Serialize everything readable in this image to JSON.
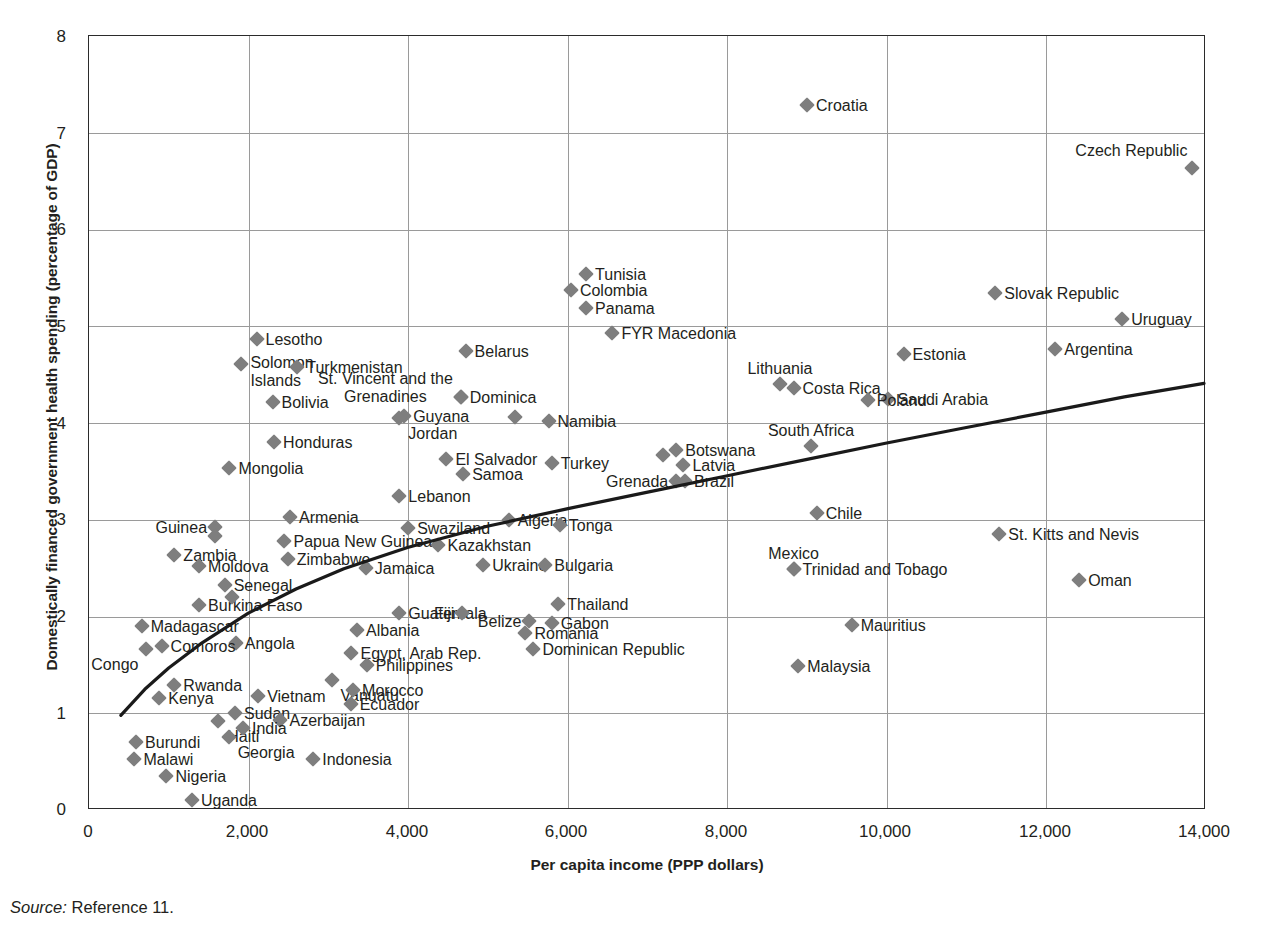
{
  "figure": {
    "source_prefix": "Source:",
    "source_text": " Reference 11."
  },
  "chart_data": {
    "type": "scatter",
    "title": "",
    "xlabel": "Per capita income (PPP dollars)",
    "ylabel": "Domestically financed government health spending (percentage of GDP)",
    "xlim": [
      0,
      14000
    ],
    "ylim": [
      0,
      8
    ],
    "xticks": [
      "0",
      "2,000",
      "4,000",
      "6,000",
      "8,000",
      "10,000",
      "12,000",
      "14,000"
    ],
    "xtick_values": [
      0,
      2000,
      4000,
      6000,
      8000,
      10000,
      12000,
      14000
    ],
    "yticks": [
      "0",
      "1",
      "2",
      "3",
      "4",
      "5",
      "6",
      "7",
      "8"
    ],
    "ytick_values": [
      0,
      1,
      2,
      3,
      4,
      5,
      6,
      7,
      8
    ],
    "grid": true,
    "legend": "none",
    "marker": "diamond",
    "marker_color": "#7e7e7e",
    "trend_line": {
      "label": "fitted trend",
      "color": "#1a1a1a",
      "points": [
        {
          "x": 400,
          "y": 0.96
        },
        {
          "x": 700,
          "y": 1.23
        },
        {
          "x": 1000,
          "y": 1.45
        },
        {
          "x": 1400,
          "y": 1.7
        },
        {
          "x": 2000,
          "y": 2.02
        },
        {
          "x": 2600,
          "y": 2.27
        },
        {
          "x": 3200,
          "y": 2.48
        },
        {
          "x": 4000,
          "y": 2.7
        },
        {
          "x": 5000,
          "y": 2.92
        },
        {
          "x": 6000,
          "y": 3.1
        },
        {
          "x": 7000,
          "y": 3.27
        },
        {
          "x": 8000,
          "y": 3.44
        },
        {
          "x": 9000,
          "y": 3.61
        },
        {
          "x": 10000,
          "y": 3.78
        },
        {
          "x": 11000,
          "y": 3.94
        },
        {
          "x": 12000,
          "y": 4.1
        },
        {
          "x": 13000,
          "y": 4.26
        },
        {
          "x": 14000,
          "y": 4.4
        }
      ]
    },
    "points": [
      {
        "name": "Croatia",
        "x": 9000,
        "y": 7.29,
        "lbl": "r"
      },
      {
        "name": "Czech Republic",
        "x": 13830,
        "y": 6.64,
        "lbl": "above-left"
      },
      {
        "name": "Tunisia",
        "x": 6230,
        "y": 5.54,
        "lbl": "r"
      },
      {
        "name": "Colombia",
        "x": 6040,
        "y": 5.37,
        "lbl": "r"
      },
      {
        "name": "Panama",
        "x": 6230,
        "y": 5.19,
        "lbl": "r"
      },
      {
        "name": "Slovak Republic",
        "x": 11360,
        "y": 5.34,
        "lbl": "r"
      },
      {
        "name": "Uruguay",
        "x": 12950,
        "y": 5.08,
        "lbl": "r"
      },
      {
        "name": "FYR Macedonia",
        "x": 6560,
        "y": 4.93,
        "lbl": "r"
      },
      {
        "name": "Lesotho",
        "x": 2100,
        "y": 4.87,
        "lbl": "r"
      },
      {
        "name": "Belarus",
        "x": 4720,
        "y": 4.74,
        "lbl": "r"
      },
      {
        "name": "Argentina",
        "x": 12110,
        "y": 4.77,
        "lbl": "r"
      },
      {
        "name": "Estonia",
        "x": 10210,
        "y": 4.71,
        "lbl": "r"
      },
      {
        "name": "Solomon Islands",
        "x": 1910,
        "y": 4.61,
        "lbl": "r-two"
      },
      {
        "name": "Turkmenistan",
        "x": 2610,
        "y": 4.58,
        "lbl": "r"
      },
      {
        "name": "Lithuania",
        "x": 8660,
        "y": 4.4,
        "lbl": "above"
      },
      {
        "name": "Costa Rica",
        "x": 8830,
        "y": 4.36,
        "lbl": "r"
      },
      {
        "name": "St. Vincent and the Grenadines",
        "x": 4660,
        "y": 4.27,
        "lbl": "l-two"
      },
      {
        "name": "Dominica",
        "x": 4660,
        "y": 4.27,
        "lbl": "r"
      },
      {
        "name": "Saudi Arabia",
        "x": 10020,
        "y": 4.25,
        "lbl": "r"
      },
      {
        "name": "Poland",
        "x": 9760,
        "y": 4.24,
        "lbl": "r"
      },
      {
        "name": "Bolivia",
        "x": 2300,
        "y": 4.22,
        "lbl": "r"
      },
      {
        "name": "Guyana",
        "x": 3950,
        "y": 4.07,
        "lbl": "r"
      },
      {
        "name": "Jordan",
        "x": 3890,
        "y": 4.05,
        "lbl": "r-below"
      },
      {
        "name": "Samoa-north",
        "x": 5340,
        "y": 4.06,
        "lbl": "none"
      },
      {
        "name": "Namibia",
        "x": 5760,
        "y": 4.02,
        "lbl": "r"
      },
      {
        "name": "Honduras",
        "x": 2320,
        "y": 3.8,
        "lbl": "r"
      },
      {
        "name": "South Africa",
        "x": 9050,
        "y": 3.76,
        "lbl": "above"
      },
      {
        "name": "Botswana",
        "x": 7360,
        "y": 3.72,
        "lbl": "r"
      },
      {
        "name": "Botswana-pair",
        "x": 7200,
        "y": 3.67,
        "lbl": "none"
      },
      {
        "name": "Latvia",
        "x": 7450,
        "y": 3.57,
        "lbl": "r"
      },
      {
        "name": "Mongolia",
        "x": 1760,
        "y": 3.53,
        "lbl": "r"
      },
      {
        "name": "El Salvador",
        "x": 4480,
        "y": 3.63,
        "lbl": "r"
      },
      {
        "name": "Turkey",
        "x": 5800,
        "y": 3.59,
        "lbl": "r"
      },
      {
        "name": "Samoa",
        "x": 4690,
        "y": 3.47,
        "lbl": "r"
      },
      {
        "name": "Grenada",
        "x": 7360,
        "y": 3.4,
        "lbl": "l"
      },
      {
        "name": "Brazil",
        "x": 7470,
        "y": 3.4,
        "lbl": "r"
      },
      {
        "name": "Lebanon",
        "x": 3890,
        "y": 3.25,
        "lbl": "r"
      },
      {
        "name": "Chile",
        "x": 9120,
        "y": 3.07,
        "lbl": "r"
      },
      {
        "name": "Armenia",
        "x": 2520,
        "y": 3.03,
        "lbl": "r"
      },
      {
        "name": "Algeria",
        "x": 5260,
        "y": 3.0,
        "lbl": "r"
      },
      {
        "name": "Tonga",
        "x": 5900,
        "y": 2.95,
        "lbl": "r"
      },
      {
        "name": "Swaziland",
        "x": 4000,
        "y": 2.91,
        "lbl": "r"
      },
      {
        "name": "St. Kitts and Nevis",
        "x": 11410,
        "y": 2.85,
        "lbl": "r"
      },
      {
        "name": "Papua New Guinea",
        "x": 2450,
        "y": 2.78,
        "lbl": "r"
      },
      {
        "name": "Kazakhstan",
        "x": 4380,
        "y": 2.74,
        "lbl": "r"
      },
      {
        "name": "Guinea",
        "x": 1580,
        "y": 2.93,
        "lbl": "l"
      },
      {
        "name": "Guinea-pair",
        "x": 1580,
        "y": 2.83,
        "lbl": "none"
      },
      {
        "name": "Zambia",
        "x": 1070,
        "y": 2.64,
        "lbl": "r"
      },
      {
        "name": "Zimbabwe",
        "x": 2490,
        "y": 2.59,
        "lbl": "r"
      },
      {
        "name": "Moldova",
        "x": 1380,
        "y": 2.52,
        "lbl": "r"
      },
      {
        "name": "Jamaica",
        "x": 3470,
        "y": 2.5,
        "lbl": "r"
      },
      {
        "name": "Ukraine",
        "x": 4940,
        "y": 2.53,
        "lbl": "r"
      },
      {
        "name": "Bulgaria",
        "x": 5720,
        "y": 2.53,
        "lbl": "r"
      },
      {
        "name": "Mexico",
        "x": 8830,
        "y": 2.49,
        "lbl": "above"
      },
      {
        "name": "Trinidad and Tobago",
        "x": 8830,
        "y": 2.49,
        "lbl": "r"
      },
      {
        "name": "Oman",
        "x": 12410,
        "y": 2.38,
        "lbl": "r"
      },
      {
        "name": "Senegal",
        "x": 1700,
        "y": 2.33,
        "lbl": "r"
      },
      {
        "name": "Burkina Faso",
        "x": 1380,
        "y": 2.12,
        "lbl": "r"
      },
      {
        "name": "Burkina-pair",
        "x": 1790,
        "y": 2.2,
        "lbl": "none"
      },
      {
        "name": "Guatemala",
        "x": 3890,
        "y": 2.04,
        "lbl": "r"
      },
      {
        "name": "Fiji",
        "x": 4680,
        "y": 2.04,
        "lbl": "l"
      },
      {
        "name": "Thailand",
        "x": 5880,
        "y": 2.13,
        "lbl": "r"
      },
      {
        "name": "Belize",
        "x": 5520,
        "y": 1.95,
        "lbl": "l"
      },
      {
        "name": "Gabon",
        "x": 5800,
        "y": 1.93,
        "lbl": "r"
      },
      {
        "name": "Madagascar",
        "x": 660,
        "y": 1.9,
        "lbl": "r"
      },
      {
        "name": "Angola",
        "x": 1840,
        "y": 1.73,
        "lbl": "r"
      },
      {
        "name": "Romania",
        "x": 5470,
        "y": 1.83,
        "lbl": "r"
      },
      {
        "name": "Albania",
        "x": 3360,
        "y": 1.86,
        "lbl": "r"
      },
      {
        "name": "Mauritius",
        "x": 9560,
        "y": 1.91,
        "lbl": "r"
      },
      {
        "name": "Comoros",
        "x": 910,
        "y": 1.69,
        "lbl": "r"
      },
      {
        "name": "Congo",
        "x": 720,
        "y": 1.66,
        "lbl": "l-below"
      },
      {
        "name": "Egypt, Arab Rep.",
        "x": 3290,
        "y": 1.62,
        "lbl": "r"
      },
      {
        "name": "Dominican Republic",
        "x": 5570,
        "y": 1.66,
        "lbl": "r"
      },
      {
        "name": "Philippines",
        "x": 3480,
        "y": 1.5,
        "lbl": "r"
      },
      {
        "name": "Malaysia",
        "x": 8890,
        "y": 1.49,
        "lbl": "r"
      },
      {
        "name": "Vanuatu",
        "x": 3040,
        "y": 1.34,
        "lbl": "r-below"
      },
      {
        "name": "Morocco",
        "x": 3310,
        "y": 1.24,
        "lbl": "r"
      },
      {
        "name": "Ecuador",
        "x": 3280,
        "y": 1.1,
        "lbl": "r"
      },
      {
        "name": "Vietnam",
        "x": 2120,
        "y": 1.18,
        "lbl": "r"
      },
      {
        "name": "Rwanda",
        "x": 1070,
        "y": 1.29,
        "lbl": "r"
      },
      {
        "name": "Kenya",
        "x": 880,
        "y": 1.16,
        "lbl": "r"
      },
      {
        "name": "Sudan",
        "x": 1830,
        "y": 1.0,
        "lbl": "r"
      },
      {
        "name": "Haiti",
        "x": 1620,
        "y": 0.92,
        "lbl": "r-below"
      },
      {
        "name": "Azerbaijan",
        "x": 2400,
        "y": 0.93,
        "lbl": "r"
      },
      {
        "name": "India",
        "x": 1930,
        "y": 0.85,
        "lbl": "r"
      },
      {
        "name": "Georgia",
        "x": 1750,
        "y": 0.75,
        "lbl": "r-below"
      },
      {
        "name": "Burundi",
        "x": 590,
        "y": 0.7,
        "lbl": "r"
      },
      {
        "name": "Malawi",
        "x": 570,
        "y": 0.53,
        "lbl": "r"
      },
      {
        "name": "Nigeria",
        "x": 970,
        "y": 0.35,
        "lbl": "r"
      },
      {
        "name": "Indonesia",
        "x": 2810,
        "y": 0.53,
        "lbl": "r"
      },
      {
        "name": "Uganda",
        "x": 1290,
        "y": 0.1,
        "lbl": "r"
      }
    ]
  }
}
